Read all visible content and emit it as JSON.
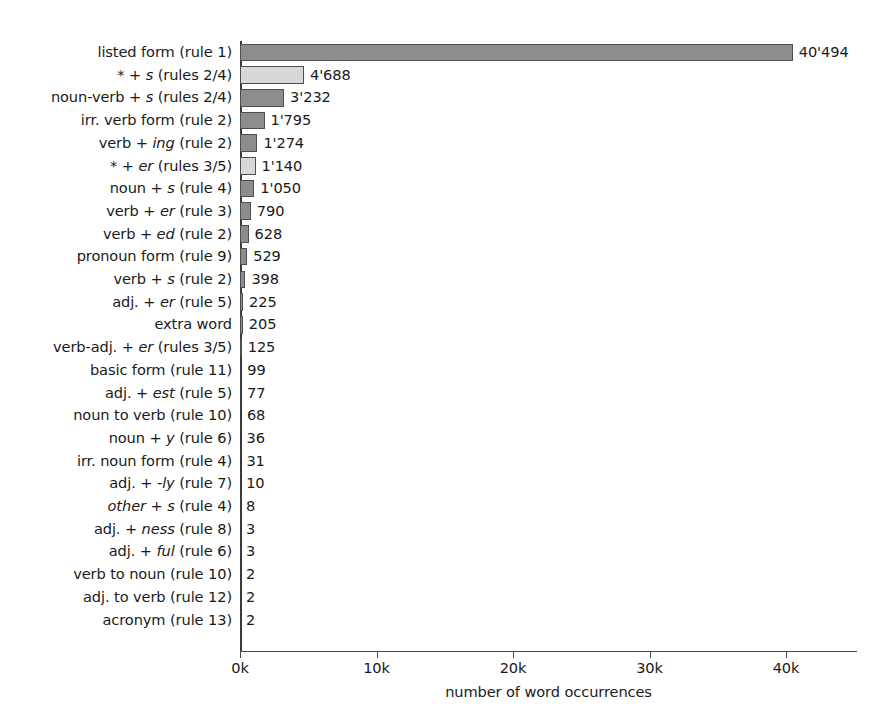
{
  "chart_data": {
    "type": "bar",
    "orientation": "horizontal",
    "title": "",
    "xlabel": "number of word occurrences",
    "ylabel": "",
    "xlim": [
      0,
      45000
    ],
    "xticks": [
      0,
      10000,
      20000,
      30000,
      40000
    ],
    "xtick_labels": [
      "0k",
      "10k",
      "20k",
      "30k",
      "40k"
    ],
    "grid": false,
    "legend": null,
    "colors": {
      "primary_bar": "#8d8d8d",
      "aggregate_bar": "#d8d8d8",
      "bar_edge": "#4e4e4e",
      "axis": "#4a4a4a",
      "text": "#1a1a1a",
      "background": "#ffffff"
    },
    "categories": [
      "listed form (rule 1)",
      "* + s (rules 2/4)",
      "noun-verb + s (rules 2/4)",
      "irr. verb form (rule 2)",
      "verb + ing (rule 2)",
      "* + er (rules 3/5)",
      "noun + s (rule 4)",
      "verb + er (rule 3)",
      "verb + ed (rule 2)",
      "pronoun form (rule 9)",
      "verb + s (rule 2)",
      "adj. + er (rule 5)",
      "extra word",
      "verb-adj. + er (rules 3/5)",
      "basic form (rule 11)",
      "adj. + est (rule 5)",
      "noun to verb (rule 10)",
      "noun + y (rule 6)",
      "irr. noun form (rule 4)",
      "adj. + -ly (rule 7)",
      "other + s (rule 4)",
      "adj. + ness (rule 8)",
      "adj. + ful (rule 6)",
      "verb to noun (rule 10)",
      "adj. to verb (rule 12)",
      "acronym (rule 13)"
    ],
    "values": [
      40494,
      4688,
      3232,
      1795,
      1274,
      1140,
      1050,
      790,
      628,
      529,
      398,
      225,
      205,
      125,
      99,
      77,
      68,
      36,
      31,
      10,
      8,
      3,
      3,
      2,
      2,
      2
    ],
    "value_labels": [
      "40'494",
      "4'688",
      "3'232",
      "1'795",
      "1'274",
      "1'140",
      "1'050",
      "790",
      "628",
      "529",
      "398",
      "225",
      "205",
      "125",
      "99",
      "77",
      "68",
      "36",
      "31",
      "10",
      "8",
      "3",
      "3",
      "2",
      "2",
      "2"
    ],
    "bars": [
      {
        "label_html": "listed form (rule 1)",
        "value": 40494,
        "value_label": "40'494",
        "style": "dark"
      },
      {
        "label_html": "* + <i>s</i> (rules 2/4)",
        "value": 4688,
        "value_label": "4'688",
        "style": "light"
      },
      {
        "label_html": "noun-verb + <i>s</i> (rules 2/4)",
        "value": 3232,
        "value_label": "3'232",
        "style": "dark"
      },
      {
        "label_html": "irr. verb form (rule 2)",
        "value": 1795,
        "value_label": "1'795",
        "style": "dark"
      },
      {
        "label_html": "verb + <i>ing</i> (rule 2)",
        "value": 1274,
        "value_label": "1'274",
        "style": "dark"
      },
      {
        "label_html": "* + <i>er</i> (rules 3/5)",
        "value": 1140,
        "value_label": "1'140",
        "style": "light"
      },
      {
        "label_html": "noun + <i>s</i> (rule 4)",
        "value": 1050,
        "value_label": "1'050",
        "style": "dark"
      },
      {
        "label_html": "verb + <i>er</i> (rule 3)",
        "value": 790,
        "value_label": "790",
        "style": "dark"
      },
      {
        "label_html": "verb + <i>ed</i> (rule 2)",
        "value": 628,
        "value_label": "628",
        "style": "dark"
      },
      {
        "label_html": "pronoun form (rule 9)",
        "value": 529,
        "value_label": "529",
        "style": "dark"
      },
      {
        "label_html": "verb + <i>s</i> (rule 2)",
        "value": 398,
        "value_label": "398",
        "style": "dark"
      },
      {
        "label_html": "adj. + <i>er</i> (rule 5)",
        "value": 225,
        "value_label": "225",
        "style": "dark"
      },
      {
        "label_html": "extra word",
        "value": 205,
        "value_label": "205",
        "style": "dark"
      },
      {
        "label_html": "verb-adj. + <i>er</i> (rules 3/5)",
        "value": 125,
        "value_label": "125",
        "style": "dark"
      },
      {
        "label_html": "basic form (rule 11)",
        "value": 99,
        "value_label": "99",
        "style": "dark"
      },
      {
        "label_html": "adj. + <i>est</i> (rule 5)",
        "value": 77,
        "value_label": "77",
        "style": "dark"
      },
      {
        "label_html": "noun to verb (rule 10)",
        "value": 68,
        "value_label": "68",
        "style": "dark"
      },
      {
        "label_html": "noun + <i>y</i> (rule 6)",
        "value": 36,
        "value_label": "36",
        "style": "dark"
      },
      {
        "label_html": "irr. noun form (rule 4)",
        "value": 31,
        "value_label": "31",
        "style": "dark"
      },
      {
        "label_html": "adj. + <i>-ly</i> (rule 7)",
        "value": 10,
        "value_label": "10",
        "style": "dark"
      },
      {
        "label_html": "<i>other</i> + <i>s</i> (rule 4)",
        "value": 8,
        "value_label": "8",
        "style": "dark"
      },
      {
        "label_html": "adj. + <i>ness</i> (rule 8)",
        "value": 3,
        "value_label": "3",
        "style": "dark"
      },
      {
        "label_html": "adj. + <i>ful</i> (rule 6)",
        "value": 3,
        "value_label": "3",
        "style": "dark"
      },
      {
        "label_html": "verb to noun (rule 10)",
        "value": 2,
        "value_label": "2",
        "style": "dark"
      },
      {
        "label_html": "adj. to verb (rule 12)",
        "value": 2,
        "value_label": "2",
        "style": "dark"
      },
      {
        "label_html": "acronym (rule 13)",
        "value": 2,
        "value_label": "2",
        "style": "dark"
      }
    ]
  }
}
